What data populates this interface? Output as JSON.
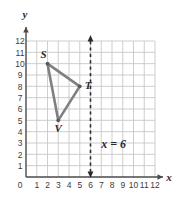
{
  "chart_data": {
    "type": "scatter",
    "title": "",
    "xlabel": "x",
    "ylabel": "y",
    "xlim": [
      0,
      12
    ],
    "ylim": [
      0,
      12
    ],
    "grid": true,
    "x_ticks": [
      "0",
      "1",
      "2",
      "3",
      "4",
      "5",
      "6",
      "7",
      "8",
      "9",
      "10",
      "11",
      "12"
    ],
    "y_ticks": [
      "0",
      "1",
      "2",
      "3",
      "4",
      "5",
      "6",
      "7",
      "8",
      "9",
      "10",
      "11",
      "12"
    ],
    "legend": "none",
    "shapes": [
      {
        "name": "triangle-STV",
        "type": "polygon",
        "closed": true,
        "color": "#808080",
        "vertices": [
          {
            "label": "S",
            "x": 2,
            "y": 10,
            "label_pos": "above-left"
          },
          {
            "label": "T",
            "x": 5,
            "y": 8,
            "label_pos": "right"
          },
          {
            "label": "V",
            "x": 3,
            "y": 5,
            "label_pos": "below"
          }
        ]
      }
    ],
    "annotations": [
      {
        "name": "vertical-line-x6",
        "type": "vline",
        "x": 6,
        "style": "dashed",
        "arrows": "both",
        "color": "#2b2b2b",
        "label": "x = 6",
        "label_x": 7.0,
        "label_y": 2.6
      }
    ]
  },
  "axes": {
    "x_name": "x",
    "y_name": "y",
    "origin_label": "0"
  },
  "labels": {
    "s": "S",
    "t": "T",
    "v": "V",
    "line_equation": "x = 6"
  },
  "ticks": {
    "x": [
      "1",
      "2",
      "3",
      "4",
      "5",
      "6",
      "7",
      "8",
      "9",
      "10",
      "11",
      "12"
    ],
    "y": [
      "1",
      "2",
      "3",
      "4",
      "5",
      "6",
      "7",
      "8",
      "9",
      "10",
      "11",
      "12"
    ]
  },
  "colors": {
    "grid": "#c8c8c8",
    "axis": "#4a4a4a",
    "triangle": "#808080",
    "dashed_line": "#2b2b2b",
    "text": "#2b2b2b",
    "background": "#ffffff"
  }
}
